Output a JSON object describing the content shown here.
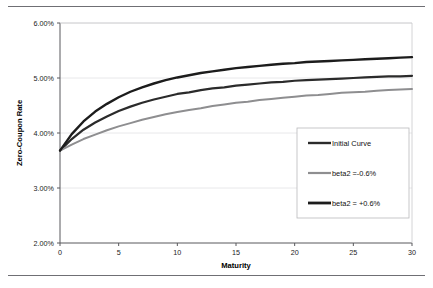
{
  "figure": {
    "top_rule": "horizontal-rule",
    "bottom_rule": "horizontal-rule"
  },
  "chart_data": {
    "type": "line",
    "title": "",
    "xlabel": "Maturity",
    "ylabel": "Zero-Coupon Rate",
    "xlim": [
      0,
      30
    ],
    "ylim": [
      0.02,
      0.06
    ],
    "xticks": [
      0,
      5,
      10,
      15,
      20,
      25,
      30
    ],
    "xtick_labels": [
      "0",
      "5",
      "10",
      "15",
      "20",
      "25",
      "30"
    ],
    "yticks": [
      0.02,
      0.03,
      0.04,
      0.05,
      0.06
    ],
    "ytick_labels": [
      "2.00%",
      "3.00%",
      "4.00%",
      "5.00%",
      "6.00%"
    ],
    "grid": true,
    "grid_axis": "y",
    "legend_position": "center-right",
    "x": [
      0,
      1,
      2,
      3,
      4,
      5,
      6,
      7,
      8,
      9,
      10,
      11,
      12,
      13,
      14,
      15,
      16,
      17,
      18,
      19,
      20,
      21,
      22,
      23,
      24,
      25,
      26,
      27,
      28,
      29,
      30
    ],
    "series": [
      {
        "name": "Initial Curve",
        "color": "#2b2b2b",
        "width": 2.2,
        "values": [
          0.0368,
          0.0389,
          0.0406,
          0.0419,
          0.043,
          0.044,
          0.0448,
          0.0455,
          0.0461,
          0.0466,
          0.0471,
          0.0474,
          0.0478,
          0.0481,
          0.0483,
          0.0486,
          0.0488,
          0.049,
          0.0492,
          0.0493,
          0.0495,
          0.0496,
          0.0497,
          0.0498,
          0.0499,
          0.05,
          0.0501,
          0.0502,
          0.0503,
          0.0503,
          0.0504
        ]
      },
      {
        "name": "beta2 =-0.6%",
        "color": "#8e8e90",
        "width": 2.0,
        "values": [
          0.0368,
          0.0379,
          0.0389,
          0.0397,
          0.0405,
          0.0412,
          0.0418,
          0.0424,
          0.0429,
          0.0434,
          0.0438,
          0.0442,
          0.0445,
          0.0449,
          0.0452,
          0.0455,
          0.0457,
          0.046,
          0.0462,
          0.0464,
          0.0466,
          0.0468,
          0.0469,
          0.0471,
          0.0473,
          0.0474,
          0.0475,
          0.0477,
          0.0478,
          0.0479,
          0.048
        ]
      },
      {
        "name": "beta2 = +0.6%",
        "color": "#1c1c1c",
        "width": 2.4,
        "values": [
          0.0368,
          0.0398,
          0.0421,
          0.0439,
          0.0453,
          0.0465,
          0.0475,
          0.0483,
          0.049,
          0.0496,
          0.0501,
          0.0505,
          0.0509,
          0.0512,
          0.0515,
          0.0518,
          0.052,
          0.0522,
          0.0524,
          0.0526,
          0.0527,
          0.0529,
          0.053,
          0.0531,
          0.0532,
          0.0533,
          0.0534,
          0.0535,
          0.0536,
          0.0537,
          0.0538
        ]
      }
    ],
    "legend": [
      {
        "label": "Initial Curve",
        "color": "#2b2b2b",
        "width": 2.4
      },
      {
        "label": "beta2 =-0.6%",
        "color": "#8e8e90",
        "width": 2.2
      },
      {
        "label": "beta2 = +0.6%",
        "color": "#1c1c1c",
        "width": 2.8
      }
    ]
  }
}
